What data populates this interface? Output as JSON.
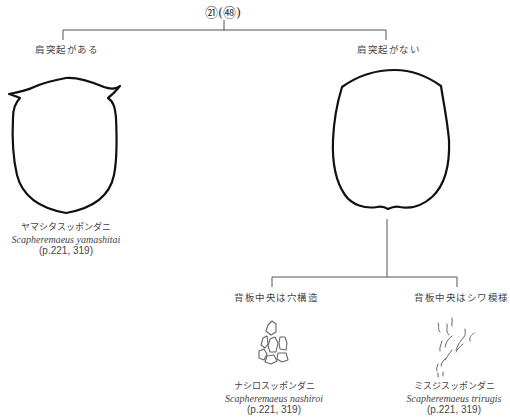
{
  "couplet": {
    "number": "㉑",
    "previous": "㊽",
    "label": "㉑(㊽)"
  },
  "branches": [
    {
      "condition": "肩突起がある",
      "species": {
        "japanese_name": "ヤマシタスッポンダニ",
        "scientific_name": "Scapheremaeus yamashitai",
        "pages": "(p.221, 319)"
      },
      "illustration": "notogaster-outline-with-shoulder-projections"
    },
    {
      "condition": "肩突起がない",
      "illustration": "notogaster-outline-without-shoulder-projections",
      "sub_branches": [
        {
          "condition": "背板中央は穴構造",
          "species": {
            "japanese_name": "ナシロスッポンダニ",
            "scientific_name": "Scapheremaeus nashiroi",
            "pages": "(p.221, 319)"
          },
          "illustration": "foveolate-pattern"
        },
        {
          "condition": "背板中央はシワ模様",
          "species": {
            "japanese_name": "ミスジスッポンダニ",
            "scientific_name": "Scapheremaeus trirugis",
            "pages": "(p.221, 319)"
          },
          "illustration": "rugose-wrinkle-pattern"
        }
      ]
    }
  ]
}
